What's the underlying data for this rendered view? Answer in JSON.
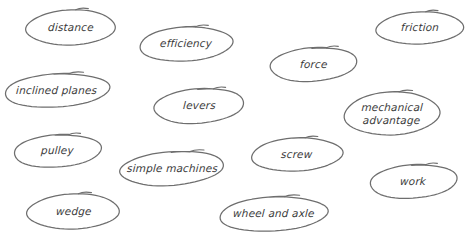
{
  "canvas": {
    "width": 466,
    "height": 241,
    "background": "#ffffff",
    "stroke_color": "#6e6e6e",
    "text_color": "#3a3a3a"
  },
  "diagram": {
    "type": "concept-bubble-map",
    "topic": "simple machines",
    "nodes": [
      {
        "id": "distance",
        "label": "distance",
        "x": 25,
        "y": 8,
        "w": 92,
        "h": 39,
        "lines": 1
      },
      {
        "id": "efficiency",
        "label": "efficiency",
        "x": 138,
        "y": 25,
        "w": 96,
        "h": 38,
        "lines": 1
      },
      {
        "id": "force",
        "label": "force",
        "x": 268,
        "y": 46,
        "w": 91,
        "h": 37,
        "lines": 1
      },
      {
        "id": "friction",
        "label": "friction",
        "x": 375,
        "y": 10,
        "w": 90,
        "h": 36,
        "lines": 1
      },
      {
        "id": "inclined-planes",
        "label": "inclined planes",
        "x": 3,
        "y": 72,
        "w": 108,
        "h": 37,
        "lines": 1
      },
      {
        "id": "levers",
        "label": "levers",
        "x": 152,
        "y": 87,
        "w": 94,
        "h": 38,
        "lines": 1
      },
      {
        "id": "mechanical-advantage",
        "label": "mechanical\nadvantage",
        "x": 343,
        "y": 90,
        "w": 98,
        "h": 47,
        "lines": 2
      },
      {
        "id": "pulley",
        "label": "pulley",
        "x": 12,
        "y": 133,
        "w": 91,
        "h": 36,
        "lines": 1
      },
      {
        "id": "simple-machines",
        "label": "simple machines",
        "x": 118,
        "y": 150,
        "w": 108,
        "h": 37,
        "lines": 1
      },
      {
        "id": "screw",
        "label": "screw",
        "x": 250,
        "y": 136,
        "w": 94,
        "h": 37,
        "lines": 1
      },
      {
        "id": "work",
        "label": "work",
        "x": 368,
        "y": 163,
        "w": 91,
        "h": 37,
        "lines": 1
      },
      {
        "id": "wedge",
        "label": "wedge",
        "x": 26,
        "y": 192,
        "w": 95,
        "h": 39,
        "lines": 1
      },
      {
        "id": "wheel-and-axle",
        "label": "wheel and axle",
        "x": 218,
        "y": 195,
        "w": 111,
        "h": 38,
        "lines": 1
      }
    ]
  }
}
